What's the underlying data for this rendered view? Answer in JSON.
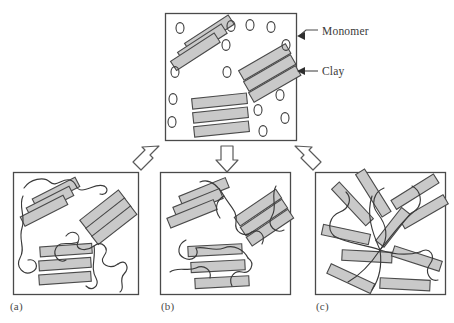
{
  "figure": {
    "type": "schematic-diagram",
    "background_color": "#ffffff"
  },
  "colors": {
    "clay_fill": "#c9c9c9",
    "clay_stroke": "#4a4a4a",
    "monomer_stroke": "#3d3d3d",
    "polymer_stroke": "#3a3a3a",
    "panel_border": "#4a4a4a",
    "arrow_stroke": "#5a5a5a",
    "label_text": "#3a3a3a"
  },
  "legend": {
    "monomer": {
      "label": "Monomer",
      "icon": "ellipse-outline-icon",
      "leader": "arrow-left-icon"
    },
    "clay": {
      "label": "Clay",
      "icon": "gray-platelet-icon",
      "leader": "arrow-left-icon"
    }
  },
  "top_panel": {
    "name": "precursor-mixture-panel",
    "monomer_count": 14,
    "clay_stack_count": 3,
    "clay_platelet_count": 9,
    "description": "Clay stacks dispersed among free monomer units"
  },
  "transition_arrows": [
    {
      "name": "arrow-to-panel-a",
      "direction": "down-left",
      "icon": "block-arrow-icon"
    },
    {
      "name": "arrow-to-panel-b",
      "direction": "down",
      "icon": "block-arrow-icon"
    },
    {
      "name": "arrow-to-panel-c",
      "direction": "down-right",
      "icon": "block-arrow-icon"
    }
  ],
  "panels": [
    {
      "id": "a",
      "label": "(a)",
      "name": "phase-separated-microcomposite-panel",
      "clay_platelet_count": 9,
      "stack_count": 3,
      "polymer_chains": 4,
      "description": "Clay stacks remain aggregated, polymer outside galleries"
    },
    {
      "id": "b",
      "label": "(b)",
      "name": "intercalated-nanocomposite-panel",
      "clay_platelet_count": 9,
      "stack_count": 3,
      "polymer_chains": 5,
      "description": "Polymer chains intercalate between clay layers, stacks preserved"
    },
    {
      "id": "c",
      "label": "(c)",
      "name": "exfoliated-nanocomposite-panel",
      "clay_platelet_count": 10,
      "stack_count": 0,
      "polymer_chains": 7,
      "description": "Individual platelets fully exfoliated and randomly dispersed in polymer"
    }
  ]
}
